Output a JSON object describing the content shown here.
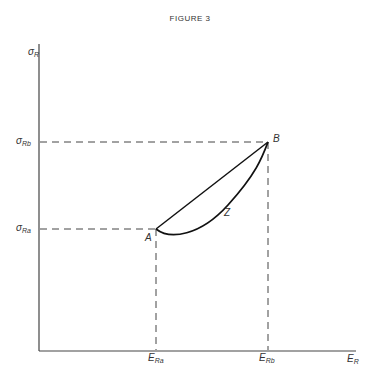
{
  "figure": {
    "title": "FIGURE 3"
  },
  "axes": {
    "y_label": {
      "main": "σ",
      "sub": "R"
    },
    "x_label": {
      "main": "E",
      "sub": "R"
    }
  },
  "ticks": {
    "y": [
      {
        "main": "σ",
        "sub": "Rb"
      },
      {
        "main": "σ",
        "sub": "Ra"
      }
    ],
    "x": [
      {
        "main": "E",
        "sub": "Ra"
      },
      {
        "main": "E",
        "sub": "Rb"
      }
    ]
  },
  "points": {
    "A": "A",
    "B": "B"
  },
  "curve_label": "Z",
  "colors": {
    "ink": "#222222",
    "background": "#ffffff"
  }
}
